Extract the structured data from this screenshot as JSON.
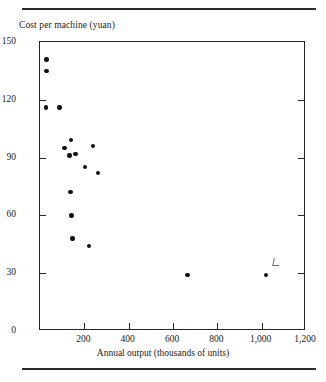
{
  "chart_data": {
    "type": "scatter",
    "title": "",
    "xlabel": "Annual output (thousands of units)",
    "ylabel": "Cost per machine (yuan)",
    "xlim": [
      0,
      1200
    ],
    "ylim": [
      0,
      150
    ],
    "grid": false,
    "legend": null,
    "xticks": [
      0,
      200,
      400,
      600,
      800,
      1000,
      1200
    ],
    "xticklabels": [
      "",
      "200",
      "400",
      "600",
      "800",
      "1,000",
      "1,200"
    ],
    "yticks": [
      0,
      30,
      60,
      90,
      120,
      150
    ],
    "yticklabels": [
      "0",
      "30",
      "60",
      "90",
      "120",
      "150"
    ],
    "points": [
      {
        "x": 30,
        "y": 141
      },
      {
        "x": 30,
        "y": 135
      },
      {
        "x": 26,
        "y": 116
      },
      {
        "x": 88,
        "y": 116
      },
      {
        "x": 140,
        "y": 99
      },
      {
        "x": 111,
        "y": 95
      },
      {
        "x": 160,
        "y": 92
      },
      {
        "x": 133,
        "y": 91
      },
      {
        "x": 240,
        "y": 96
      },
      {
        "x": 204,
        "y": 85
      },
      {
        "x": 262,
        "y": 82
      },
      {
        "x": 137,
        "y": 72
      },
      {
        "x": 142,
        "y": 60
      },
      {
        "x": 146,
        "y": 48
      },
      {
        "x": 222,
        "y": 44
      },
      {
        "x": 665,
        "y": 29
      },
      {
        "x": 1020,
        "y": 29
      }
    ],
    "annotations": [
      {
        "name": "scan-mark",
        "x": 1050,
        "y": 34,
        "text": ""
      }
    ]
  },
  "axes": {
    "y_caption": "Cost per machine (yuan)",
    "x_caption": "Annual output (thousands of units)"
  }
}
